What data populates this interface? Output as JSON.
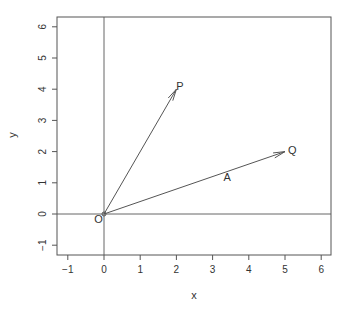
{
  "chart_data": {
    "type": "scatter",
    "title": "",
    "xlabel": "x",
    "ylabel": "y",
    "xlim": [
      -1.3,
      6.3
    ],
    "ylim": [
      -1.3,
      6.3
    ],
    "x_ticks": [
      -1,
      0,
      1,
      2,
      3,
      4,
      5,
      6
    ],
    "y_ticks": [
      -1,
      0,
      1,
      2,
      3,
      4,
      5,
      6
    ],
    "grid": false,
    "reference_lines": [
      {
        "type": "vertical",
        "x": 0
      },
      {
        "type": "horizontal",
        "y": 0
      }
    ],
    "points": [
      {
        "label": "O",
        "x": 0,
        "y": 0
      },
      {
        "label": "P",
        "x": 2,
        "y": 4
      },
      {
        "label": "Q",
        "x": 5,
        "y": 2
      }
    ],
    "vectors": [
      {
        "from": "O",
        "to": "P",
        "x0": 0,
        "y0": 0,
        "x1": 2,
        "y1": 4
      },
      {
        "from": "O",
        "to": "Q",
        "x0": 0,
        "y0": 0,
        "x1": 5,
        "y1": 2,
        "label": "A"
      }
    ],
    "annotations": [
      {
        "text": "O",
        "x": -0.15,
        "y": -0.15
      },
      {
        "text": "P",
        "x": 2.1,
        "y": 4.1
      },
      {
        "text": "Q",
        "x": 5.2,
        "y": 2.05
      },
      {
        "text": "A",
        "x": 3.4,
        "y": 1.2
      }
    ]
  }
}
